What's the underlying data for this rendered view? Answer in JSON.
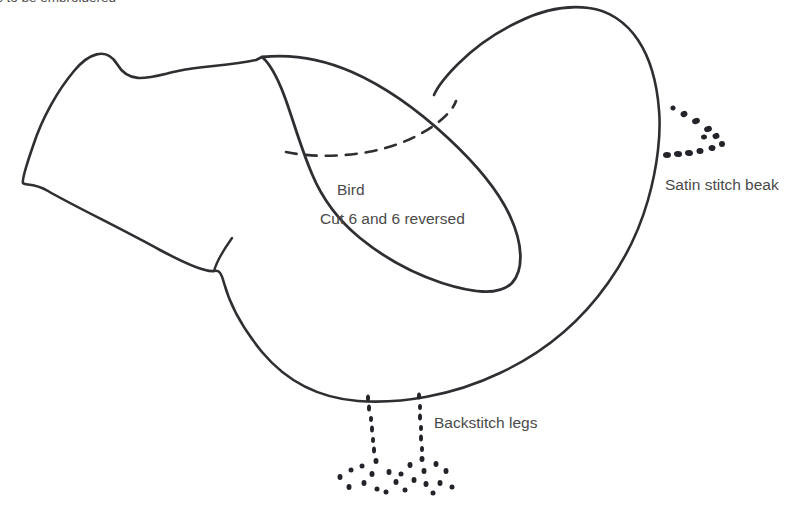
{
  "page": {
    "background_color": "#ffffff",
    "ink_color": "#2f2f33",
    "text_color": "#4a4a4a",
    "width": 803,
    "height": 513
  },
  "header": {
    "note": "s to be embroidered"
  },
  "labels": {
    "piece_name": "Bird",
    "cut_instruction": "Cut 6 and 6 reversed",
    "beak_instruction": "Satin stitch beak",
    "legs_instruction": "Backstitch legs"
  },
  "shapes": {
    "body_name": "bird-body-outline",
    "wing_name": "bird-wing-outline",
    "wing_fold_name": "wing-fold-dashed-line",
    "beak_name": "satin-stitch-beak-dots",
    "legs_name": "backstitch-legs-dots"
  },
  "paths": {
    "body": "M 262 57 L 256 60 C 230 66 200 66 178 71 C 150 77 130 86 117 64 C 106 46 88 54 74 71 C 58 90 42 118 33 146 C 24 172 22 180 23 183 C 25 186 33 182 48 191 C 70 204 120 228 160 250 C 190 266 208 272 214 271 C 219 270 221 272 224 283 C 230 305 244 330 262 352 C 288 383 320 398 358 401 C 400 404 452 396 500 373 C 545 352 582 320 608 283 C 628 255 640 228 648 200 C 658 165 661 132 659 110 C 657 84 650 58 638 40 C 626 22 608 10 589 8 C 566 5 542 10 518 22 C 495 33 474 48 458 64 C 444 78 437 88 434 95",
    "wing": "M 262 57 C 290 54 320 58 352 72 C 386 87 420 112 448 138 C 476 164 498 190 510 216 C 523 244 524 270 512 283 C 498 297 470 292 442 283 C 412 273 382 256 360 238 C 338 220 322 198 312 174 C 300 146 292 116 284 95 C 276 74 268 62 262 57 Z",
    "wing_fold": "M 286 152 C 310 157 340 157 368 152 C 396 147 420 136 436 124 C 448 115 454 107 456 101",
    "tail_crease": "M 214 271 C 216 264 222 252 232 238"
  },
  "beak_dots": [
    {
      "x": 673,
      "y": 108,
      "w": 5,
      "h": 5,
      "r": -28
    },
    {
      "x": 684,
      "y": 114,
      "w": 7,
      "h": 6,
      "r": -25
    },
    {
      "x": 696,
      "y": 121,
      "w": 8,
      "h": 6,
      "r": -22
    },
    {
      "x": 708,
      "y": 129,
      "w": 8,
      "h": 6,
      "r": -20
    },
    {
      "x": 716,
      "y": 136,
      "w": 7,
      "h": 6,
      "r": -18
    },
    {
      "x": 722,
      "y": 144,
      "w": 6,
      "h": 6,
      "r": 0
    },
    {
      "x": 712,
      "y": 148,
      "w": 7,
      "h": 6,
      "r": 8
    },
    {
      "x": 700,
      "y": 151,
      "w": 7,
      "h": 6,
      "r": 5
    },
    {
      "x": 689,
      "y": 153,
      "w": 8,
      "h": 6,
      "r": 3
    },
    {
      "x": 678,
      "y": 154,
      "w": 8,
      "h": 6,
      "r": 2
    },
    {
      "x": 667,
      "y": 155,
      "w": 8,
      "h": 6,
      "r": 0
    },
    {
      "x": 704,
      "y": 137,
      "w": 6,
      "h": 5,
      "r": -10
    }
  ],
  "leg_left_dots": [
    {
      "x": 368,
      "y": 398,
      "w": 4,
      "h": 7
    },
    {
      "x": 369,
      "y": 408,
      "w": 4,
      "h": 7
    },
    {
      "x": 371,
      "y": 419,
      "w": 4,
      "h": 6
    },
    {
      "x": 372,
      "y": 429,
      "w": 4,
      "h": 7
    },
    {
      "x": 373,
      "y": 440,
      "w": 4,
      "h": 6
    },
    {
      "x": 374,
      "y": 450,
      "w": 4,
      "h": 7
    },
    {
      "x": 376,
      "y": 461,
      "w": 5,
      "h": 6
    },
    {
      "x": 362,
      "y": 466,
      "w": 5,
      "h": 5
    },
    {
      "x": 351,
      "y": 470,
      "w": 5,
      "h": 5
    },
    {
      "x": 340,
      "y": 477,
      "w": 5,
      "h": 6
    },
    {
      "x": 349,
      "y": 487,
      "w": 5,
      "h": 6
    },
    {
      "x": 364,
      "y": 483,
      "w": 5,
      "h": 6
    },
    {
      "x": 372,
      "y": 474,
      "w": 5,
      "h": 6
    },
    {
      "x": 377,
      "y": 489,
      "w": 5,
      "h": 5
    },
    {
      "x": 389,
      "y": 472,
      "w": 5,
      "h": 6
    },
    {
      "x": 396,
      "y": 482,
      "w": 5,
      "h": 6
    },
    {
      "x": 386,
      "y": 492,
      "w": 5,
      "h": 5
    }
  ],
  "leg_right_dots": [
    {
      "x": 419,
      "y": 396,
      "w": 4,
      "h": 7
    },
    {
      "x": 420,
      "y": 407,
      "w": 4,
      "h": 6
    },
    {
      "x": 420,
      "y": 417,
      "w": 4,
      "h": 7
    },
    {
      "x": 421,
      "y": 428,
      "w": 4,
      "h": 6
    },
    {
      "x": 421,
      "y": 438,
      "w": 4,
      "h": 7
    },
    {
      "x": 422,
      "y": 449,
      "w": 4,
      "h": 6
    },
    {
      "x": 422,
      "y": 459,
      "w": 5,
      "h": 6
    },
    {
      "x": 410,
      "y": 465,
      "w": 5,
      "h": 6
    },
    {
      "x": 401,
      "y": 474,
      "w": 5,
      "h": 5
    },
    {
      "x": 414,
      "y": 480,
      "w": 5,
      "h": 6
    },
    {
      "x": 405,
      "y": 490,
      "w": 5,
      "h": 5
    },
    {
      "x": 424,
      "y": 471,
      "w": 5,
      "h": 6
    },
    {
      "x": 426,
      "y": 484,
      "w": 5,
      "h": 6
    },
    {
      "x": 436,
      "y": 464,
      "w": 5,
      "h": 6
    },
    {
      "x": 446,
      "y": 471,
      "w": 5,
      "h": 6
    },
    {
      "x": 440,
      "y": 483,
      "w": 5,
      "h": 6
    },
    {
      "x": 452,
      "y": 487,
      "w": 5,
      "h": 5
    },
    {
      "x": 433,
      "y": 493,
      "w": 5,
      "h": 5
    }
  ]
}
